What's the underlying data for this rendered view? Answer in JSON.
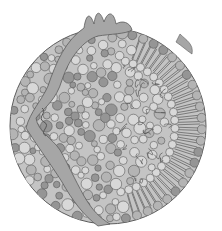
{
  "figure": {
    "colors": {
      "background": "#ffffff",
      "outline": "#5c5c5c",
      "light_sphere": "#d8d8d8",
      "mid_sphere": "#b4b4b4",
      "dark_sphere": "#959595",
      "protein_band": "#a6a6a6",
      "tail_stripe": "#7a7a7a",
      "core_fill": "#c4c4c4"
    },
    "particle": {
      "cx": 108,
      "cy": 126,
      "r": 98
    },
    "components": [
      {
        "name": "apolipoprotein-band"
      },
      {
        "name": "phospholipid-heads"
      },
      {
        "name": "fatty-acid-tails"
      },
      {
        "name": "cholesterol-core"
      }
    ]
  }
}
